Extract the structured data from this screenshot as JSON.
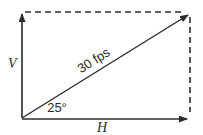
{
  "diagram": {
    "labels": {
      "vertical_component": "V",
      "horizontal_component": "H",
      "vector_magnitude": "30 fps",
      "angle": "25°"
    },
    "colors": {
      "line": "#2b2b2b",
      "background": "#ffffff"
    }
  }
}
